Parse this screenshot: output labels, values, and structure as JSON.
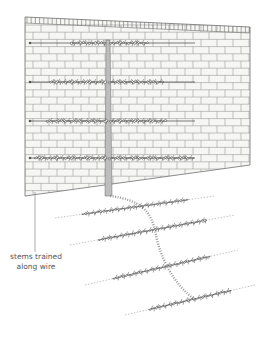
{
  "illustration": {
    "subject": "espalier trained against brick wall with ground plan of stems",
    "colors": {
      "brick_line": "#7a7a7a",
      "wall_fill": "#f4f4f2",
      "trunk": "#8a8a8a",
      "foliage": "#5a5a5a",
      "wire": "#444444",
      "ground_stem": "#9a9a9a"
    },
    "wall": {
      "top_left": [
        25,
        17
      ],
      "top_right": [
        250,
        27
      ],
      "bottom_left": [
        25,
        196
      ],
      "bottom_right": [
        250,
        165
      ]
    },
    "trunk_x": 108,
    "tiers": [
      {
        "y": 43,
        "left_x": 70,
        "right_x": 148
      },
      {
        "y": 82,
        "left_x": 50,
        "right_x": 162
      },
      {
        "y": 121,
        "left_x": 48,
        "right_x": 166
      },
      {
        "y": 158,
        "left_x": 35,
        "right_x": 192
      }
    ],
    "ground_tiers": [
      {
        "y1": 218,
        "y2": 196,
        "x1": 55,
        "x2": 215
      },
      {
        "y1": 245,
        "y2": 215,
        "x1": 70,
        "x2": 235
      },
      {
        "y1": 285,
        "y2": 250,
        "x1": 85,
        "x2": 238
      },
      {
        "y1": 315,
        "y2": 285,
        "x1": 125,
        "x2": 255
      }
    ]
  },
  "annotations": [
    {
      "id": "stems-trained",
      "line1": "stems trained",
      "line2": "along wire"
    }
  ]
}
